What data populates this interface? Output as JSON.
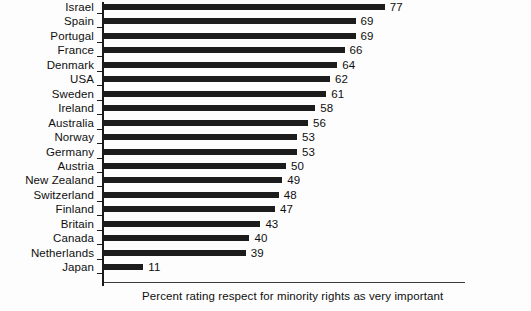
{
  "chart_data": {
    "type": "bar",
    "orientation": "horizontal",
    "title": "",
    "subtitle": "",
    "caption": "Percent rating respect for minority rights as very important",
    "xlabel": "",
    "ylabel": "",
    "xlim": [
      0,
      80
    ],
    "grid": false,
    "legend": null,
    "value_labels_shown": true,
    "bar_color": "#1c1c1c",
    "categories": [
      "Israel",
      "Spain",
      "Portugal",
      "France",
      "Denmark",
      "USA",
      "Sweden",
      "Ireland",
      "Australia",
      "Norway",
      "Germany",
      "Austria",
      "New Zealand",
      "Switzerland",
      "Finland",
      "Britain",
      "Canada",
      "Netherlands",
      "Japan"
    ],
    "values": [
      77,
      69,
      69,
      66,
      64,
      62,
      61,
      58,
      56,
      53,
      53,
      50,
      49,
      48,
      47,
      43,
      40,
      39,
      11
    ],
    "value_label_texts": [
      "77",
      "69",
      "69",
      "66",
      "64",
      "62",
      "61",
      "58",
      "56",
      "53",
      "53",
      "50",
      "49",
      "48",
      "47",
      "43",
      "40",
      "39",
      "11"
    ]
  }
}
